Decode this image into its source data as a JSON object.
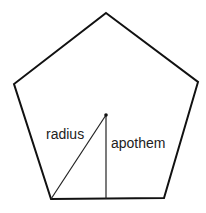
{
  "diagram": {
    "shape": "regular pentagon",
    "vertices": [
      [
        106,
        13
      ],
      [
        198,
        82
      ],
      [
        164,
        198
      ],
      [
        51,
        199
      ],
      [
        14,
        84
      ]
    ],
    "center": [
      106,
      115
    ],
    "stroke_color": "#111111",
    "labels": {
      "radius": "radius",
      "apothem": "apothem"
    },
    "radius_segment": {
      "from": [
        106,
        115
      ],
      "to": [
        51,
        199
      ]
    },
    "apothem_segment": {
      "from": [
        106,
        115
      ],
      "to": [
        106,
        199
      ]
    }
  }
}
